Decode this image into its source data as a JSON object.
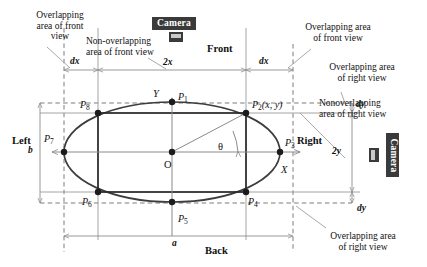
{
  "figure": {
    "type": "geometry-diagram"
  },
  "annotations": {
    "overlap_front_left_l1": "Overlapping",
    "overlap_front_left_l2": "area of front",
    "overlap_front_left_l3": "view",
    "nonoverlap_front_l1": "Non-overlapping",
    "nonoverlap_front_l2": "area of front view",
    "overlap_front_right_l1": "Overlapping area",
    "overlap_front_right_l2": "of front view",
    "overlap_right_top_l1": "Overlapping area",
    "overlap_right_top_l2": "of right view",
    "nonoverlap_right_l1": "Nonoverlapping",
    "nonoverlap_right_l2": "area of right view",
    "overlap_right_bottom_l1": "Overlapping area",
    "overlap_right_bottom_l2": "of right view"
  },
  "sides": {
    "front": "Front",
    "back": "Back",
    "left": "Left",
    "right": "Right"
  },
  "dimensions": {
    "dx_left": "dx",
    "dx_right": "dx",
    "two_x": "2x",
    "dy_top": "dy",
    "dy_bottom": "dy",
    "two_y": "2y",
    "a": "a",
    "b": "b"
  },
  "axes": {
    "x_axis": "X",
    "y_axis": "Y",
    "origin": "O",
    "angle": "θ"
  },
  "points": [
    {
      "id": "P1",
      "base": "P",
      "sub": "1",
      "suffix": ""
    },
    {
      "id": "P2",
      "base": "P",
      "sub": "2",
      "suffix": "(x, y)"
    },
    {
      "id": "P3",
      "base": "P",
      "sub": "3",
      "suffix": ""
    },
    {
      "id": "P4",
      "base": "P",
      "sub": "4",
      "suffix": ""
    },
    {
      "id": "P5",
      "base": "P",
      "sub": "5",
      "suffix": ""
    },
    {
      "id": "P6",
      "base": "P",
      "sub": "6",
      "suffix": ""
    },
    {
      "id": "P7",
      "base": "P",
      "sub": "7",
      "suffix": ""
    },
    {
      "id": "P8",
      "base": "P",
      "sub": "8",
      "suffix": ""
    }
  ],
  "cameras": {
    "top_label": "Camera",
    "right_label": "Camera"
  },
  "colors": {
    "ellipse_stroke": "#3d3d3d",
    "rect_stroke": "#2b2b2b",
    "guide_solid": "#9a9a9a",
    "guide_dashed": "#6e6e6e",
    "dimension_line": "#8d8d8d",
    "leader_line": "#9a9a9a",
    "point_fill": "#1c1c1c",
    "camera_badge": "#3a3a3a",
    "background": "#ffffff"
  },
  "geometry": {
    "center": {
      "x": 172,
      "y": 152
    },
    "ellipse_rx": 108,
    "ellipse_ry": 50,
    "rect_left_x": 98,
    "rect_right_x": 246,
    "rect_top_y": 113,
    "rect_bottom_y": 192,
    "guide_dashed_left_x": 64,
    "guide_dashed_right_x": 293,
    "guide_dashed_top_y": 103,
    "guide_dashed_bottom_y": 203,
    "theta_degrees": 28
  }
}
